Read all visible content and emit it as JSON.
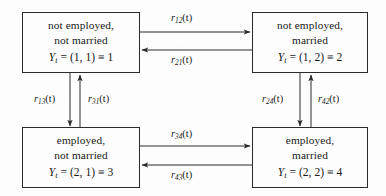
{
  "diagram": {
    "type": "state-transition-diagram",
    "title": "",
    "background_color": "#fdfdfd",
    "line_color": "#2b2b2b",
    "states": [
      {
        "id": "state-1",
        "line1": "not employed,",
        "line2": "not married",
        "math": "Y_t = (1, 1) ≡ 1",
        "math_var": "Y",
        "math_sub": "t",
        "math_rest": " = (1, 1) ≡ 1",
        "index": 1,
        "position": "top-left"
      },
      {
        "id": "state-2",
        "line1": "not employed,",
        "line2": "married",
        "math": "Y_t = (1, 2) ≡ 2",
        "math_var": "Y",
        "math_sub": "t",
        "math_rest": " = (1, 2) ≡ 2",
        "index": 2,
        "position": "top-right"
      },
      {
        "id": "state-3",
        "line1": "employed,",
        "line2": "not married",
        "math": "Y_t = (2, 1) ≡ 3",
        "math_var": "Y",
        "math_sub": "t",
        "math_rest": " = (2, 1) ≡ 3",
        "index": 3,
        "position": "bottom-left"
      },
      {
        "id": "state-4",
        "line1": "employed,",
        "line2": "married",
        "math": "Y_t = (2, 2) ≡ 4",
        "math_var": "Y",
        "math_sub": "t",
        "math_rest": " = (2, 2) ≡ 4",
        "index": 4,
        "position": "bottom-right"
      }
    ],
    "transitions": [
      {
        "id": "r12",
        "from": 1,
        "to": 2,
        "sym": "r",
        "sub": "12",
        "rest": "(t)",
        "label": "r12(t)",
        "orientation": "horizontal",
        "direction": "right"
      },
      {
        "id": "r21",
        "from": 2,
        "to": 1,
        "sym": "r",
        "sub": "21",
        "rest": "(t)",
        "label": "r21(t)",
        "orientation": "horizontal",
        "direction": "left"
      },
      {
        "id": "r13",
        "from": 1,
        "to": 3,
        "sym": "r",
        "sub": "13",
        "rest": "(t)",
        "label": "r13(t)",
        "orientation": "vertical",
        "direction": "down"
      },
      {
        "id": "r31",
        "from": 3,
        "to": 1,
        "sym": "r",
        "sub": "31",
        "rest": "(t)",
        "label": "r31(t)",
        "orientation": "vertical",
        "direction": "up"
      },
      {
        "id": "r24",
        "from": 2,
        "to": 4,
        "sym": "r",
        "sub": "24",
        "rest": "(t)",
        "label": "r24(t)",
        "orientation": "vertical",
        "direction": "down"
      },
      {
        "id": "r42",
        "from": 4,
        "to": 2,
        "sym": "r",
        "sub": "42",
        "rest": "(t)",
        "label": "r42(t)",
        "orientation": "vertical",
        "direction": "up"
      },
      {
        "id": "r34",
        "from": 3,
        "to": 4,
        "sym": "r",
        "sub": "34",
        "rest": "(t)",
        "label": "r34(t)",
        "orientation": "horizontal",
        "direction": "right"
      },
      {
        "id": "r43",
        "from": 4,
        "to": 3,
        "sym": "r",
        "sub": "43",
        "rest": "(t)",
        "label": "r43(t)",
        "orientation": "horizontal",
        "direction": "left"
      }
    ]
  }
}
